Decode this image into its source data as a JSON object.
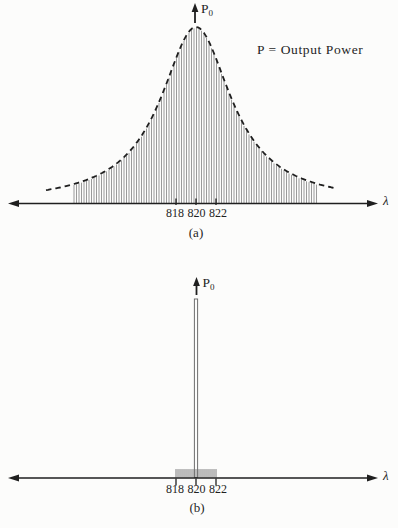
{
  "figure": {
    "background": "#fcfcfb",
    "ink": "#1f1f1f",
    "hatch_color": "#8f8f8f",
    "spike_color": "#6e6e6e",
    "annotation": "P = Output Power"
  },
  "plots": [
    {
      "caption": "(a)",
      "y_axis_label": {
        "base": "P",
        "sub": "0"
      },
      "x_axis_label": "λ",
      "tick_labels": [
        "818",
        "820",
        "822"
      ]
    },
    {
      "caption": "(b)",
      "y_axis_label": {
        "base": "P",
        "sub": "0"
      },
      "x_axis_label": "λ",
      "tick_labels": [
        "818",
        "820",
        "822"
      ]
    }
  ],
  "chart_data": [
    {
      "type": "area",
      "caption": "(a)",
      "description": "Broad output spectrum: dashed Lorentzian envelope filled with vertical hatching",
      "xlabel": "λ",
      "ylabel": "P0",
      "annotation": "P = Output Power",
      "x_ticks": [
        818,
        820,
        822
      ],
      "x_axis_range": [
        801,
        838
      ],
      "ylim": [
        0,
        1
      ],
      "envelope_style": "dashed",
      "fill_style": "vertical-hatch",
      "curve": {
        "shape": "lorentzian",
        "center": 820,
        "hwhm": 4.3,
        "peak": 1.0,
        "extent": [
          805,
          834
        ]
      },
      "hatch": {
        "extent": [
          807.8,
          832.2
        ],
        "step": 0.25
      },
      "sample_points": {
        "x": [
          806,
          808,
          810,
          812,
          814,
          816,
          818,
          820,
          822,
          824,
          826,
          828,
          830,
          832,
          834
        ],
        "y": [
          0.09,
          0.11,
          0.16,
          0.22,
          0.34,
          0.54,
          0.82,
          1.0,
          0.82,
          0.54,
          0.34,
          0.22,
          0.16,
          0.11,
          0.09
        ]
      }
    },
    {
      "type": "line",
      "caption": "(b)",
      "description": "Narrow output spectrum: single dominant spike at 820 with small side modes",
      "xlabel": "λ",
      "ylabel": "P0",
      "x_ticks": [
        818,
        820,
        822
      ],
      "x_axis_range": [
        801,
        838
      ],
      "ylim": [
        0,
        1
      ],
      "spike": {
        "center": 820,
        "height": 1.0,
        "width_nm": 0.32
      },
      "side_modes": {
        "extent": [
          818,
          822
        ],
        "step": 0.2,
        "height": 0.05
      }
    }
  ]
}
